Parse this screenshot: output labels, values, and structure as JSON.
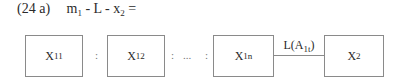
{
  "equation": {
    "number": "(24 a)",
    "parts": {
      "m": "m",
      "m_sub": "1",
      "mid": " - L - ",
      "x": "x",
      "x_sub": "2",
      "eq": " ="
    }
  },
  "boxes": [
    {
      "base": "X",
      "sub": "11"
    },
    {
      "base": "X",
      "sub": "12"
    },
    {
      "base": "X",
      "sub": "1n"
    },
    {
      "base": "X",
      "sub": "2"
    }
  ],
  "separators": [
    ":",
    ":",
    "...",
    ":"
  ],
  "connector": {
    "label": "L(A",
    "label_sub": "1t",
    "label_end": ")"
  },
  "colors": {
    "border": "#8a8a8a",
    "text": "#2a2a2a"
  }
}
